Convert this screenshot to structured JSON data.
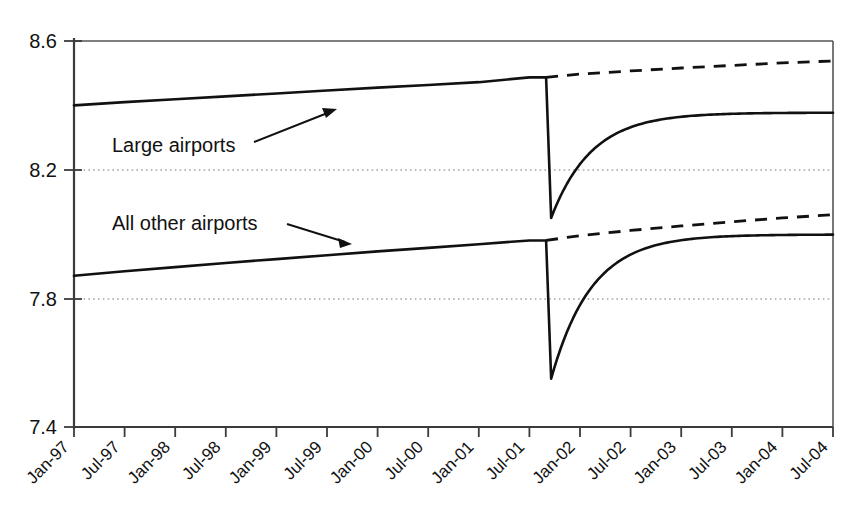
{
  "chart_data": {
    "type": "line",
    "title": "",
    "subtitle": "",
    "xlabel": "",
    "ylabel": "",
    "ylim": [
      7.4,
      8.6
    ],
    "yticks": [
      "7.4",
      "7.8",
      "8.2",
      "8.6"
    ],
    "ytick_values": [
      7.4,
      7.8,
      8.2,
      8.6
    ],
    "grid": "horizontal dotted gridlines at 7.8 and 8.2",
    "legend": "none (inline annotations with leader arrows)",
    "categories": [
      "Jan-97",
      "Jul-97",
      "Jan-98",
      "Jul-98",
      "Jan-99",
      "Jul-99",
      "Jan-00",
      "Jul-00",
      "Jan-01",
      "Jul-01",
      "Jan-02",
      "Jul-02",
      "Jan-03",
      "Jul-03",
      "Jan-04",
      "Jul-04"
    ],
    "x_axis_note": "Monthly series; major ticks every 6 months from Jan-97 to Jul-04",
    "break_point": "Sep-01",
    "series": [
      {
        "name": "Large airports",
        "style": "solid",
        "values": [
          8.4,
          8.41,
          8.419,
          8.428,
          8.437,
          8.446,
          8.455,
          8.463,
          8.472,
          8.487,
          8.233,
          8.309,
          8.34,
          8.356,
          8.368,
          8.377
        ],
        "pre_break_end": 8.487,
        "trough": 8.05,
        "trough_label": "Sep-01",
        "recovery_end": 8.377
      },
      {
        "name": "Large airports (counterfactual)",
        "style": "dashed",
        "values": [
          null,
          null,
          null,
          null,
          null,
          null,
          null,
          null,
          null,
          8.487,
          8.497,
          8.507,
          8.516,
          8.524,
          8.532,
          8.538
        ],
        "pre_break_end": 8.487,
        "recovery_end": 8.538
      },
      {
        "name": "All other airports",
        "style": "solid",
        "values": [
          7.87,
          7.884,
          7.897,
          7.91,
          7.922,
          7.934,
          7.946,
          7.957,
          7.968,
          7.98,
          7.83,
          7.93,
          7.962,
          7.978,
          7.99,
          7.998
        ],
        "pre_break_end": 7.98,
        "trough": 7.55,
        "trough_label": "Sep-01",
        "recovery_end": 7.998
      },
      {
        "name": "All other airports (counterfactual)",
        "style": "dashed",
        "values": [
          null,
          null,
          null,
          null,
          null,
          null,
          null,
          null,
          null,
          7.98,
          7.995,
          8.011,
          8.025,
          8.038,
          8.05,
          8.06
        ],
        "pre_break_end": 7.98,
        "recovery_end": 8.06
      }
    ],
    "annotations": [
      {
        "text": "Large airports",
        "target_series": "Large airports",
        "arrow_direction": "up-right"
      },
      {
        "text": "All other airports",
        "target_series": "All other airports",
        "arrow_direction": "down-right"
      }
    ],
    "colors": {
      "line": "#111111",
      "axis": "#3b3b3b",
      "grid": "#777777",
      "background": "#ffffff"
    }
  }
}
